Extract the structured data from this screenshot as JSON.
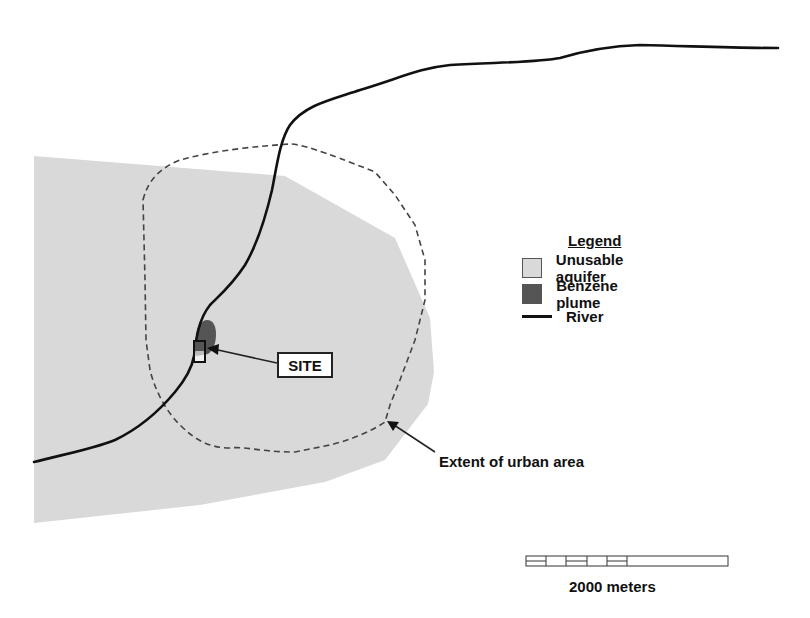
{
  "map": {
    "colors": {
      "background": "#ffffff",
      "aquifer": "#d9d9d9",
      "plume": "#555555",
      "river": "#111111",
      "urban_boundary": "#444444"
    },
    "features": [
      {
        "name": "Unusable aquifer",
        "type": "polygon-fill"
      },
      {
        "name": "Benzene plume",
        "type": "polygon-fill"
      },
      {
        "name": "River",
        "type": "line"
      },
      {
        "name": "Extent of urban area",
        "type": "dashed-line"
      },
      {
        "name": "SITE",
        "type": "rectangle-marker"
      }
    ]
  },
  "legend": {
    "title": "Legend",
    "items": [
      {
        "label": "Unusable aquifer",
        "symbol": "light-gray-swatch"
      },
      {
        "label": "Benzene plume",
        "symbol": "dark-gray-swatch"
      },
      {
        "label": "River",
        "symbol": "black-line"
      }
    ]
  },
  "annotations": {
    "site_label": "SITE",
    "urban_label": "Extent of urban area"
  },
  "scale_bar": {
    "label": "2000 meters",
    "segments": 6
  }
}
